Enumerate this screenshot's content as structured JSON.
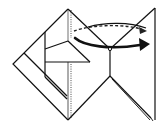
{
  "diagram": {
    "type": "origami-fold-instruction",
    "colors": {
      "line": "#111111",
      "background": "#ffffff",
      "arrow": "#111111"
    },
    "elements": [
      {
        "name": "left-diamond-flap",
        "kind": "outline"
      },
      {
        "name": "inner-layer-flaps",
        "kind": "outline"
      },
      {
        "name": "center-dotted-crease",
        "kind": "dotted-line"
      },
      {
        "name": "right-triangle-flap",
        "kind": "outline"
      },
      {
        "name": "lower-v-edges",
        "kind": "outline"
      },
      {
        "name": "fold-arrow-solid",
        "kind": "arrow",
        "direction": "left-to-right"
      },
      {
        "name": "fold-arrow-dashed",
        "kind": "arrow",
        "direction": "left-to-right",
        "style": "dashed"
      }
    ]
  }
}
